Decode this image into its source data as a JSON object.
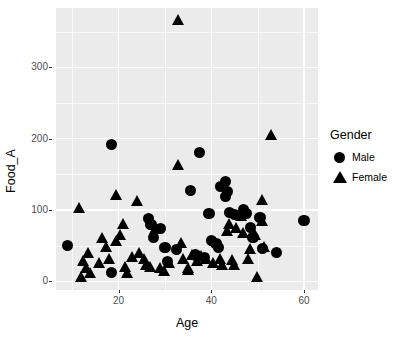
{
  "chart_data": {
    "type": "scatter",
    "title": "",
    "xlabel": "Age",
    "ylabel": "Food_A",
    "xlim": [
      6.5,
      63.0
    ],
    "ylim": [
      -12,
      383
    ],
    "xticks": [
      20,
      40,
      60
    ],
    "yticks": [
      0,
      100,
      200,
      300
    ],
    "x_minor_ticks": [
      10,
      30,
      50
    ],
    "y_minor_ticks": [
      50,
      150,
      250,
      350
    ],
    "grid": true,
    "legend": {
      "title": "Gender",
      "position": "right",
      "entries": [
        {
          "name": "Male",
          "marker": "circle",
          "color": "#000000"
        },
        {
          "name": "Female",
          "marker": "triangle",
          "color": "#000000"
        }
      ]
    },
    "panel_background": "#ebebeb",
    "grid_color": "#ffffff",
    "series": [
      {
        "name": "Male",
        "marker": "circle",
        "color": "#000000",
        "points": [
          [
            9.0,
            50
          ],
          [
            18.5,
            192
          ],
          [
            18.5,
            12
          ],
          [
            26.5,
            88
          ],
          [
            27.0,
            80
          ],
          [
            27.5,
            62
          ],
          [
            29.0,
            74
          ],
          [
            30.0,
            47
          ],
          [
            32.5,
            45
          ],
          [
            30.5,
            28
          ],
          [
            35.5,
            127
          ],
          [
            37.5,
            181
          ],
          [
            39.5,
            95
          ],
          [
            40.0,
            57
          ],
          [
            41.0,
            53
          ],
          [
            42.0,
            133
          ],
          [
            43.0,
            140
          ],
          [
            43.5,
            126
          ],
          [
            43.0,
            119
          ],
          [
            44.0,
            97
          ],
          [
            45.0,
            94
          ],
          [
            47.0,
            100
          ],
          [
            47.5,
            95
          ],
          [
            48.5,
            75
          ],
          [
            49.0,
            61
          ],
          [
            50.5,
            90
          ],
          [
            51.0,
            46
          ],
          [
            54.0,
            41
          ],
          [
            60.0,
            85
          ],
          [
            41.5,
            47
          ],
          [
            36.5,
            37
          ],
          [
            38.5,
            33
          ]
        ]
      },
      {
        "name": "Female",
        "marker": "triangle",
        "color": "#000000",
        "points": [
          [
            33.0,
            365
          ],
          [
            53.0,
            203
          ],
          [
            33.0,
            161
          ],
          [
            11.5,
            101
          ],
          [
            19.5,
            120
          ],
          [
            24.0,
            111
          ],
          [
            21.0,
            79
          ],
          [
            16.5,
            60
          ],
          [
            13.5,
            39
          ],
          [
            12.5,
            27
          ],
          [
            13.0,
            18
          ],
          [
            12.0,
            5
          ],
          [
            14.0,
            10
          ],
          [
            17.5,
            47
          ],
          [
            19.5,
            55
          ],
          [
            20.5,
            64
          ],
          [
            18.0,
            30
          ],
          [
            21.5,
            19
          ],
          [
            23.0,
            33
          ],
          [
            24.5,
            39
          ],
          [
            25.5,
            30
          ],
          [
            26.0,
            22
          ],
          [
            28.0,
            72
          ],
          [
            27.0,
            19
          ],
          [
            29.0,
            17
          ],
          [
            31.0,
            24
          ],
          [
            33.5,
            52
          ],
          [
            34.0,
            30
          ],
          [
            35.0,
            18
          ],
          [
            36.0,
            35
          ],
          [
            37.0,
            27
          ],
          [
            38.0,
            34
          ],
          [
            39.0,
            30
          ],
          [
            40.5,
            24
          ],
          [
            42.0,
            30
          ],
          [
            43.5,
            69
          ],
          [
            44.5,
            28
          ],
          [
            45.5,
            73
          ],
          [
            46.5,
            90
          ],
          [
            47.0,
            67
          ],
          [
            48.0,
            30
          ],
          [
            48.5,
            44
          ],
          [
            49.5,
            64
          ],
          [
            50.0,
            5
          ],
          [
            51.0,
            113
          ],
          [
            51.0,
            83
          ],
          [
            51.5,
            47
          ],
          [
            45.0,
            21
          ],
          [
            42.5,
            22
          ],
          [
            30.0,
            13
          ],
          [
            22.0,
            11
          ],
          [
            16.0,
            25
          ],
          [
            44.0,
            79
          ],
          [
            35.0,
            14
          ]
        ]
      }
    ]
  }
}
